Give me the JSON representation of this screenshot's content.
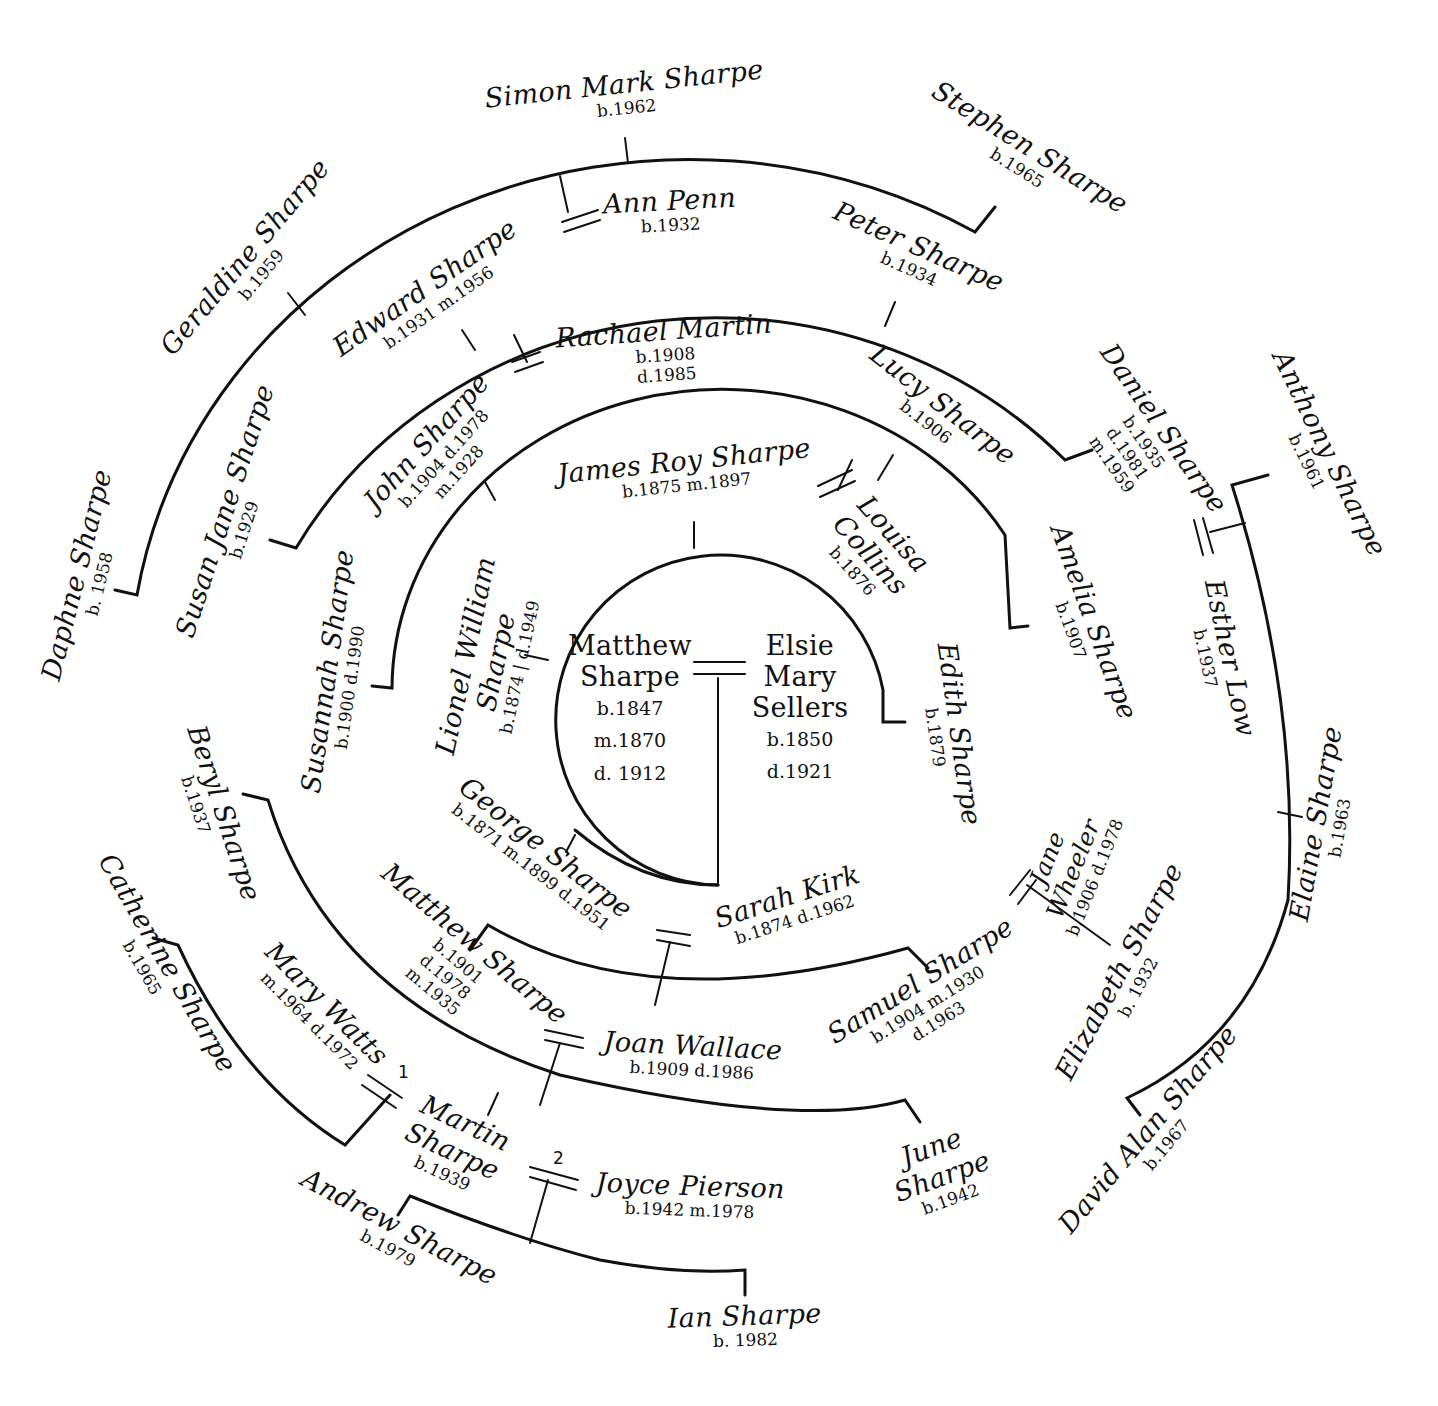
{
  "diagram": {
    "type": "circular family tree",
    "family": "Sharpe"
  },
  "root_couple": {
    "husband": {
      "name_line1": "Matthew",
      "name_line2": "Sharpe",
      "born": "b.1847",
      "married": "m.1870",
      "died": "d. 1912"
    },
    "wife": {
      "name_line1": "Elsie",
      "name_line2": "Mary",
      "name_line3": "Sellers",
      "born": "b.1850",
      "died": "d.1921"
    }
  },
  "generation1": [
    {
      "name": "George Sharpe",
      "dates": "b.1871  m.1899  d.1951",
      "spouse": {
        "name": "Sarah Kirk",
        "dates": "b.1874  d.1962"
      }
    },
    {
      "name_line1": "Lionel William",
      "name_line2": "Sharpe",
      "dates": "b.1874 | d.1949"
    },
    {
      "name": "James Roy Sharpe",
      "dates": "b.1875    m.1897",
      "spouse": {
        "name_line1": "Louisa",
        "name_line2": "Collins",
        "dates": "b.1876"
      }
    },
    {
      "name": "Edith Sharpe",
      "dates": "b.1879"
    }
  ],
  "generation2": [
    {
      "name": "Susannah Sharpe",
      "dates": "b.1900  d.1990"
    },
    {
      "name": "John Sharpe",
      "dates_line1": "b.1904   d.1978",
      "dates_line2": "m.1928",
      "spouse": {
        "name": "Rachael Martin",
        "dates_line1": "b.1908",
        "dates_line2": "d.1985"
      }
    },
    {
      "name": "Lucy Sharpe",
      "dates": "b.1906"
    },
    {
      "name": "Amelia Sharpe",
      "dates": "b.1907"
    },
    {
      "name": "Matthew Sharpe",
      "dates_line1": "b.1901",
      "dates_line2": "d.1978",
      "married": "m.1935",
      "spouse": {
        "name": "Joan Wallace",
        "dates": "b.1909  d.1986"
      }
    },
    {
      "name": "Samuel Sharpe",
      "dates_line1": "b.1904   m.1930",
      "dates_line2": "d.1963",
      "spouse": {
        "name_line1": "Jane",
        "name_line2": "Wheeler",
        "dates": "b.1906 d.1978"
      }
    }
  ],
  "generation3": [
    {
      "name": "Susan Jane Sharpe",
      "dates": "b.1929"
    },
    {
      "name": "Edward Sharpe",
      "dates": "b.1931    m.1956",
      "spouse": {
        "name": "Ann Penn",
        "dates": "b.1932"
      }
    },
    {
      "name": "Peter Sharpe",
      "dates": "b.1934"
    },
    {
      "name": "Daniel Sharpe",
      "dates_line1": "b.1935",
      "dates_line2": "d.1981",
      "married": "m.1959",
      "spouse": {
        "name": "Esther Low",
        "dates": "b.1937"
      }
    },
    {
      "name": "Beryl Sharpe",
      "dates": "b.1937"
    },
    {
      "name_line1": "Martin",
      "name_line2": "Sharpe",
      "dates": "b.1939",
      "spouse1": {
        "marker": "1",
        "name": "Mary Watts",
        "dates": "m.1964  d.1972"
      },
      "spouse2": {
        "marker": "2",
        "name": "Joyce Pierson",
        "dates": "b.1942     m.1978"
      }
    },
    {
      "name_line1": "June",
      "name_line2": "Sharpe",
      "dates": "b.1942"
    },
    {
      "name": "Elizabeth Sharpe",
      "dates": "b. 1932"
    }
  ],
  "generation4": [
    {
      "name": "Daphne Sharpe",
      "dates": "b. 1958"
    },
    {
      "name": "Geraldine Sharpe",
      "dates": "b.1959"
    },
    {
      "name": "Simon Mark Sharpe",
      "dates": "b.1962"
    },
    {
      "name": "Stephen Sharpe",
      "dates": "b.1965"
    },
    {
      "name": "Anthony Sharpe",
      "dates": "b.1961"
    },
    {
      "name": "Elaine Sharpe",
      "dates": "b.1963"
    },
    {
      "name": "David Alan Sharpe",
      "dates": "b.1967"
    },
    {
      "name": "Catherine Sharpe",
      "dates": "b.1965"
    },
    {
      "name": "Andrew Sharpe",
      "dates": "b.1979"
    },
    {
      "name": "Ian Sharpe",
      "dates": "b. 1982"
    }
  ],
  "colors": {
    "ink": "#111111",
    "paper": "#ffffff"
  }
}
